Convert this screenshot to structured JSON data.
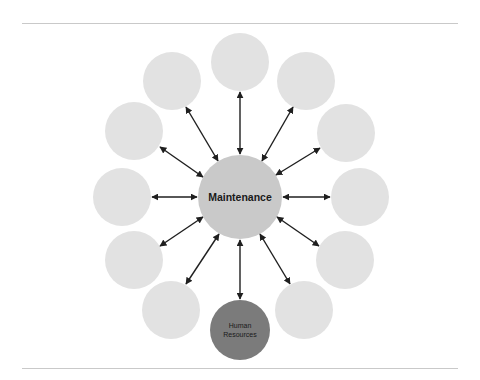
{
  "diagram": {
    "type": "hub-and-spoke",
    "center_node": {
      "label": "Maintenance",
      "cx": 240,
      "cy": 197,
      "r": 42,
      "fill": "#c9c9c9"
    },
    "highlighted_node": {
      "label_line1": "Human",
      "label_line2": "Resources",
      "position": "bottom",
      "fill": "#7b7b7b"
    },
    "outer_nodes": [
      {
        "id": "top",
        "label": "",
        "cx": 240,
        "cy": 62,
        "r": 29
      },
      {
        "id": "top-right",
        "label": "",
        "cx": 306,
        "cy": 81,
        "r": 29
      },
      {
        "id": "right-upper",
        "label": "",
        "cx": 346,
        "cy": 133,
        "r": 29
      },
      {
        "id": "right",
        "label": "",
        "cx": 360,
        "cy": 197,
        "r": 29
      },
      {
        "id": "right-lower",
        "label": "",
        "cx": 345,
        "cy": 260,
        "r": 29
      },
      {
        "id": "bottom-right",
        "label": "",
        "cx": 304,
        "cy": 310,
        "r": 29
      },
      {
        "id": "bottom",
        "label": "Human Resources",
        "cx": 240,
        "cy": 330,
        "r": 30
      },
      {
        "id": "bottom-left",
        "label": "",
        "cx": 171,
        "cy": 310,
        "r": 29
      },
      {
        "id": "left-lower",
        "label": "",
        "cx": 134,
        "cy": 260,
        "r": 29
      },
      {
        "id": "left",
        "label": "",
        "cx": 122,
        "cy": 197,
        "r": 29
      },
      {
        "id": "left-upper",
        "label": "",
        "cx": 134,
        "cy": 131,
        "r": 29
      },
      {
        "id": "top-left",
        "label": "",
        "cx": 172,
        "cy": 81,
        "r": 29
      }
    ],
    "connections": "bidirectional arrows from center to each outer node",
    "colors": {
      "outer_fill": "#e2e2e2",
      "center_fill": "#c9c9c9",
      "highlight_fill": "#7b7b7b",
      "arrow": "#1f1f1f",
      "rule": "#c9c9c9"
    }
  }
}
